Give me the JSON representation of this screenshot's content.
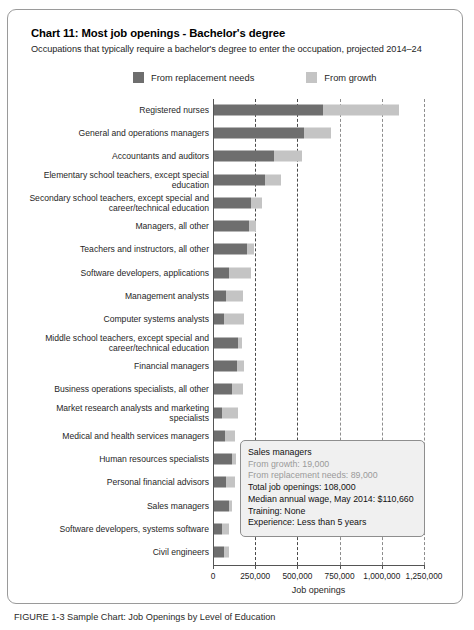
{
  "chart": {
    "title": "Chart 11: Most job openings - Bachelor's degree",
    "subtitle": "Occupations that typically require a bachelor's degree to enter the occupation, projected 2014–24"
  },
  "legend": {
    "items": [
      {
        "label": "From replacement needs",
        "color": "#6e6e6e",
        "icon": "legend-swatch-replacement"
      },
      {
        "label": "From growth",
        "color": "#c4c4c4",
        "icon": "legend-swatch-growth"
      }
    ]
  },
  "tooltip": {
    "occupation": "Sales managers",
    "from_growth": "From growth: 19,000",
    "from_replacement": "From replacement needs: 89,000",
    "total": "Total job openings: 108,000",
    "wage": "Median annual wage, May 2014: $110,660",
    "training": "Training: None",
    "experience": "Experience: Less than 5 years"
  },
  "caption": {
    "text": "FIGURE 1-3 Sample Chart: Job Openings by Level of Education"
  },
  "chart_data": {
    "type": "bar",
    "orientation": "horizontal",
    "stacked": true,
    "title": "Chart 11: Most job openings - Bachelor's degree",
    "subtitle": "Occupations that typically require a bachelor's degree to enter the occupation, projected 2014–24",
    "xlabel": "Job openings",
    "ylabel": "",
    "xlim": [
      0,
      1250000
    ],
    "xticks": [
      0,
      250000,
      500000,
      750000,
      1000000,
      1250000
    ],
    "xticklabels": [
      "0",
      "250,000",
      "500,000",
      "750,000",
      "1,000,000",
      "1,250,000"
    ],
    "grid": "vertical-dashed",
    "legend_position": "top-center",
    "categories": [
      "Registered nurses",
      "General and operations managers",
      "Accountants and auditors",
      "Elementary school teachers, except special education",
      "Secondary school teachers, except special and career/technical education",
      "Managers, all other",
      "Teachers and instructors, all other",
      "Software developers, applications",
      "Management analysts",
      "Computer systems analysts",
      "Middle school teachers, except special and career/technical education",
      "Financial managers",
      "Business operations specialists, all other",
      "Market research analysts and marketing specialists",
      "Medical and health services managers",
      "Human resources specialists",
      "Personal financial advisors",
      "Sales managers",
      "Software developers, systems software",
      "Civil engineers"
    ],
    "series": [
      {
        "name": "From replacement needs",
        "color": "#6e6e6e",
        "values": [
          643000,
          536000,
          357000,
          303000,
          220000,
          208000,
          196000,
          90000,
          70000,
          60000,
          143000,
          137000,
          108000,
          50000,
          66000,
          105000,
          72000,
          89000,
          50000,
          62000
        ]
      },
      {
        "name": "From growth",
        "color": "#c4c4c4",
        "values": [
          452000,
          160000,
          167000,
          96000,
          66000,
          41000,
          42000,
          130000,
          103000,
          118000,
          24000,
          42000,
          62000,
          92000,
          57000,
          25000,
          52000,
          19000,
          37000,
          24000
        ]
      }
    ]
  }
}
